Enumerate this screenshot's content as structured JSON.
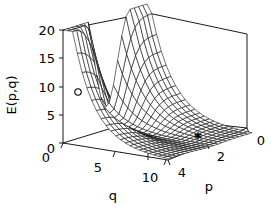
{
  "chart_data": {
    "type": "surface",
    "title": "",
    "xlabel": "q",
    "ylabel": "p",
    "zlabel": "E(p,q)",
    "projection": "3d-wireframe-mesh",
    "grid": false,
    "legend": null,
    "background_color": "#ffffff",
    "line_color": "#000000",
    "surface_fill": "#ffffff",
    "axes": {
      "z": {
        "label": "E(p,q)",
        "ticks": [
          0,
          5,
          10,
          15,
          20
        ],
        "tick_labels": [
          "0",
          "5",
          "10",
          "15",
          "20"
        ],
        "range": [
          0,
          20
        ],
        "position": "left-vertical"
      },
      "x": {
        "label": "q",
        "ticks": [
          0,
          5,
          10
        ],
        "tick_labels": [
          "0",
          "5",
          "10"
        ],
        "range": [
          0,
          11
        ],
        "position": "bottom-left-receding"
      },
      "y": {
        "label": "p",
        "ticks": [
          4,
          2,
          0
        ],
        "tick_labels": [
          "4",
          "2",
          "0"
        ],
        "range": [
          0,
          5
        ],
        "position": "bottom-right-receding",
        "direction": "decreasing-left-to-right"
      }
    },
    "markers": [
      {
        "name": "circle-marker",
        "symbol": "o",
        "x_pixel": 78,
        "y_pixel": 92,
        "q": 2.0,
        "p": 4.2,
        "E": 11.0
      },
      {
        "name": "star-marker",
        "symbol": "*",
        "x_pixel": 198,
        "y_pixel": 140,
        "q": 8.5,
        "p": 1.2,
        "E": 0.6
      }
    ],
    "mesh": {
      "q_samples": 22,
      "p_samples": 20,
      "z_max": 20,
      "z_min": 0
    }
  },
  "figure": {
    "z_tick_0": "0",
    "z_tick_5": "5",
    "z_tick_10": "10",
    "z_tick_15": "15",
    "z_tick_20": "20",
    "z_axis_title": "E(p,q)",
    "q_tick_0": "0",
    "q_tick_5": "5",
    "q_tick_10": "10",
    "q_axis_title": "q",
    "p_tick_4": "4",
    "p_tick_2": "2",
    "p_tick_0": "0",
    "p_axis_title": "p"
  }
}
